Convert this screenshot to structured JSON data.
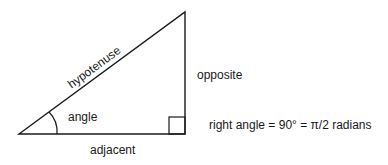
{
  "diagram": {
    "type": "right-triangle",
    "labels": {
      "hypotenuse": "hypotenuse",
      "opposite": "opposite",
      "adjacent": "adjacent",
      "angle": "angle",
      "right_angle_note": "right angle = 90° = π/2 radians"
    },
    "colors": {
      "stroke": "#1a1a1a",
      "background": "#ffffff"
    }
  }
}
